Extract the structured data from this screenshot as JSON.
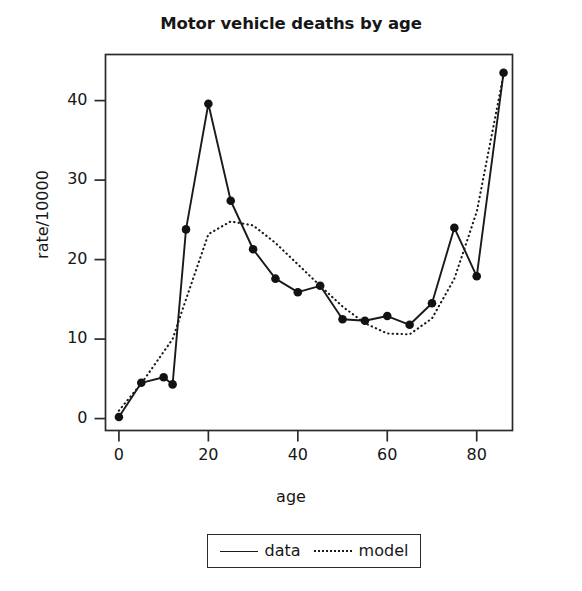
{
  "chart_data": {
    "type": "line",
    "title": "Motor vehicle deaths by age",
    "xlabel": "age",
    "ylabel": "rate/10000",
    "xlim": [
      -3,
      88
    ],
    "ylim": [
      -1.5,
      45.8
    ],
    "xticks": [
      0,
      20,
      40,
      60,
      80
    ],
    "xtick_labels": [
      "0",
      "20",
      "40",
      "60",
      "80"
    ],
    "yticks": [
      0,
      10,
      20,
      30,
      40
    ],
    "ytick_labels": [
      "0",
      "10",
      "20",
      "30",
      "40"
    ],
    "grid": false,
    "legend_position": "below-axes",
    "x": [
      0,
      5,
      10,
      12,
      15,
      20,
      25,
      30,
      35,
      40,
      45,
      50,
      55,
      60,
      65,
      70,
      75,
      80,
      86
    ],
    "series": [
      {
        "name": "data",
        "style": "solid",
        "markers": true,
        "values": [
          0.2,
          4.5,
          5.2,
          4.3,
          23.8,
          39.6,
          27.4,
          21.3,
          17.6,
          15.9,
          16.7,
          12.5,
          12.3,
          12.9,
          11.8,
          14.5,
          24.0,
          17.9,
          43.5
        ]
      },
      {
        "name": "model",
        "style": "dotted",
        "markers": false,
        "values": [
          1.0,
          4.4,
          8.4,
          10.0,
          15.0,
          23.2,
          24.8,
          24.3,
          22.1,
          19.4,
          16.7,
          14.1,
          12.0,
          10.7,
          10.6,
          12.6,
          17.6,
          26.0,
          43.3
        ]
      }
    ]
  },
  "legend": {
    "entries": [
      {
        "label": "data",
        "style": "solid"
      },
      {
        "label": "model",
        "style": "dotted"
      }
    ]
  }
}
